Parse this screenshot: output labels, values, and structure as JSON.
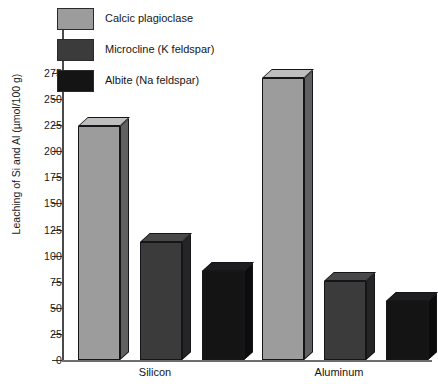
{
  "chart_data": {
    "type": "bar",
    "title": "",
    "subtitle": "",
    "xlabel": "",
    "ylabel": "Leaching of Si and Al (µmol/100 g)",
    "categories": [
      "Silicon",
      "Aluminum"
    ],
    "series": [
      {
        "name": "Calcic plagioclase",
        "values": [
          224,
          270
        ],
        "color": "#9c9c9c"
      },
      {
        "name": "Microcline (K feldspar)",
        "values": [
          113,
          76
        ],
        "color": "#3b3b3b"
      },
      {
        "name": "Albite (Na feldspar)",
        "values": [
          85,
          57
        ],
        "color": "#141414"
      }
    ],
    "ylim": [
      0,
      275
    ],
    "ytick_values": [
      0,
      25,
      50,
      75,
      100,
      125,
      150,
      175,
      200,
      225,
      250,
      275
    ],
    "ytick_labels": [
      "0",
      "25",
      "50",
      "75",
      "100",
      "125",
      "150",
      "175",
      "200",
      "225",
      "250",
      "275"
    ],
    "grid": false,
    "legend_position": "top-left",
    "style": "3d-bars"
  },
  "legend": {
    "items": [
      {
        "label": "Calcic plagioclase",
        "color": "#9c9c9c"
      },
      {
        "label": "Microcline (K feldspar)",
        "color": "#3b3b3b"
      },
      {
        "label": "Albite (Na feldspar)",
        "color": "#141414"
      }
    ]
  },
  "axes": {
    "y_title": "Leaching of Si and Al (µmol/100 g)",
    "y_ticks": [
      "275",
      "250",
      "225",
      "200",
      "175",
      "150",
      "125",
      "100",
      "75",
      "50",
      "25",
      "0"
    ],
    "x_labels": [
      "Silicon",
      "Aluminum"
    ]
  },
  "colors": {
    "series_light": "#9c9c9c",
    "series_dark": "#3b3b3b",
    "series_black": "#141414",
    "axis": "#4a4a4a",
    "text": "#1a1a1a",
    "background": "#ffffff"
  }
}
